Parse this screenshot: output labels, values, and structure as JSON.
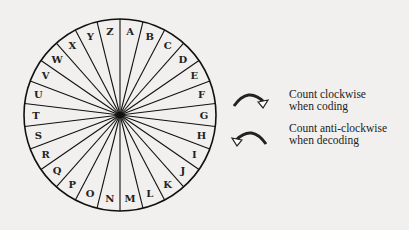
{
  "diagram": {
    "letters": [
      "A",
      "B",
      "C",
      "D",
      "E",
      "F",
      "G",
      "H",
      "I",
      "J",
      "K",
      "L",
      "M",
      "N",
      "O",
      "P",
      "Q",
      "R",
      "S",
      "T",
      "U",
      "V",
      "W",
      "X",
      "Y",
      "Z"
    ],
    "legend": [
      {
        "icon": "clockwise-arrow-icon",
        "line1": "Count clockwise",
        "line2": "when coding"
      },
      {
        "icon": "anticlockwise-arrow-icon",
        "line1": "Count anti-clockwise",
        "line2": "when decoding"
      }
    ]
  }
}
